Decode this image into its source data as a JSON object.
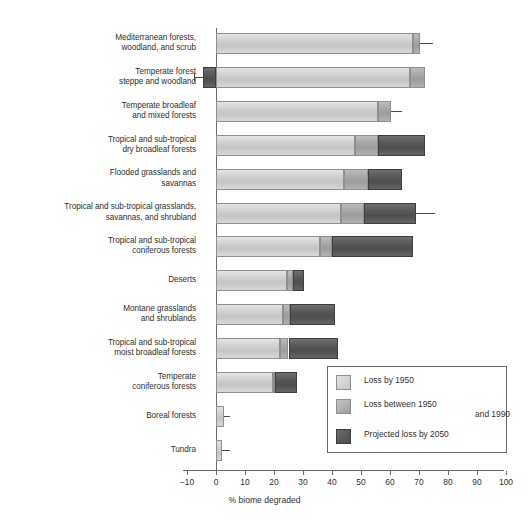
{
  "chart_data": {
    "type": "bar",
    "orientation": "horizontal",
    "stacked": true,
    "title": "",
    "xlabel": "% biome degraded",
    "ylabel": "",
    "xlim": [
      -10,
      100
    ],
    "xticks": [
      "-10",
      "0",
      "10",
      "20",
      "30",
      "40",
      "50",
      "60",
      "70",
      "80",
      "90",
      "100"
    ],
    "grid": false,
    "legend_position": "bottom-right",
    "legend": [
      "Loss by 1950",
      "Loss between 1950 and 1990",
      "Projected loss by 2050"
    ],
    "categories": [
      "Mediterranean forests, woodland, and scrub",
      "Temperate forest steppe and woodland",
      "Temperate broadleaf and mixed forests",
      "Tropical and sub-tropical dry broadleaf forests",
      "Flooded grasslands and savannas",
      "Tropical and sub-tropical grasslands, savannas, and shrubland",
      "Tropical and sub-tropical coniferous forests",
      "Deserts",
      "Montane grasslands and shrublands",
      "Tropical and sub-tropical moist broadleaf forests",
      "Temperate coniferous forests",
      "Boreal forests",
      "Tundra"
    ],
    "series": [
      {
        "name": "Loss by 1950",
        "values": [
          68.0,
          67.0,
          56.0,
          48.0,
          44.0,
          43.0,
          36.0,
          24.5,
          23.0,
          22.0,
          19.5,
          2.8,
          2.0
        ]
      },
      {
        "name": "Loss between 1950 and 1990",
        "values": [
          2.5,
          5.0,
          4.5,
          8.0,
          8.5,
          8.0,
          4.0,
          2.0,
          2.5,
          3.0,
          1.0,
          0.0,
          0.0
        ]
      },
      {
        "name": "Projected loss by 2050",
        "values": [
          0.0,
          -4.5,
          0.0,
          16.0,
          11.5,
          18.0,
          28.0,
          4.0,
          15.5,
          17.0,
          7.5,
          0.0,
          0.0
        ]
      }
    ],
    "error_bar_upper": [
      75.0,
      null,
      64.0,
      null,
      null,
      75.5,
      null,
      null,
      null,
      null,
      null,
      5.0,
      5.0
    ],
    "error_bar_lower": [
      null,
      -7.5,
      null,
      null,
      null,
      null,
      null,
      null,
      null,
      null,
      null,
      null,
      null
    ]
  },
  "axis": {
    "x_title": "% biome degraded",
    "ticks": [
      {
        "label": "-10",
        "value": -10
      },
      {
        "label": "0",
        "value": 0
      },
      {
        "label": "10",
        "value": 10
      },
      {
        "label": "20",
        "value": 20
      },
      {
        "label": "30",
        "value": 30
      },
      {
        "label": "40",
        "value": 40
      },
      {
        "label": "50",
        "value": 50
      },
      {
        "label": "60",
        "value": 60
      },
      {
        "label": "70",
        "value": 70
      },
      {
        "label": "80",
        "value": 80
      },
      {
        "label": "90",
        "value": 90
      },
      {
        "label": "100",
        "value": 100
      }
    ]
  },
  "category_labels": [
    [
      "Mediterranean forests,",
      "woodland, and scrub"
    ],
    [
      "Temperate forest",
      "steppe and woodland"
    ],
    [
      "Temperate broadleaf",
      "and mixed forests"
    ],
    [
      "Tropical and sub-tropical",
      "dry broadleaf forests"
    ],
    [
      "Flooded grasslands and",
      "savannas"
    ],
    [
      "Tropical and sub-tropical grasslands,",
      "savannas, and shrubland"
    ],
    [
      "Tropical and sub-tropical",
      "coniferous forests"
    ],
    [
      "Deserts"
    ],
    [
      "Montane grasslands",
      "and shrublands"
    ],
    [
      "Tropical and sub-tropical",
      "moist broadleaf forests"
    ],
    [
      "Temperate",
      "coniferous forests"
    ],
    [
      "Boreal forests"
    ],
    [
      "Tundra"
    ]
  ],
  "legend": {
    "items": [
      {
        "label_lines": [
          "Loss by 1950"
        ],
        "color": "#c8c8c8"
      },
      {
        "label_lines": [
          "Loss between 1950",
          "and 1990"
        ],
        "color": "#9d9d9d"
      },
      {
        "label_lines": [
          "Projected loss by 2050"
        ],
        "color": "#4b4b4b"
      }
    ]
  },
  "colors": {
    "segment_1": "#c8c8c8",
    "segment_2": "#9d9d9d",
    "segment_3": "#4b4b4b",
    "axis": "#6a6a6a",
    "text": "#2f2f2f",
    "background": "#ffffff"
  }
}
